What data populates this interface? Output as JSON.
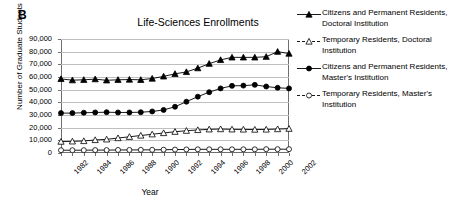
{
  "panel": {
    "label": "B"
  },
  "chart_data": {
    "type": "line",
    "title": "Life-Sciences Enrollments",
    "xlabel": "Year",
    "ylabel": "Number of Graduate Students",
    "grid": true,
    "legend_position": "right",
    "ylim": [
      0,
      90000
    ],
    "yticks": [
      "0",
      "10,000",
      "20,000",
      "30,000",
      "40,000",
      "50,000",
      "60,000",
      "70,000",
      "80,000",
      "90,000"
    ],
    "ytick_values": [
      0,
      10000,
      20000,
      30000,
      40000,
      50000,
      60000,
      70000,
      80000,
      90000
    ],
    "x": [
      1982,
      1983,
      1984,
      1985,
      1986,
      1987,
      1988,
      1989,
      1990,
      1991,
      1992,
      1993,
      1994,
      1995,
      1996,
      1997,
      1998,
      1999,
      2000,
      2001,
      2002
    ],
    "xtick_labels": [
      "1982",
      "1984",
      "1986",
      "1988",
      "1990",
      "1992",
      "1994",
      "1996",
      "1998",
      "2000",
      "2002"
    ],
    "xtick_values": [
      1982,
      1984,
      1986,
      1988,
      1990,
      1992,
      1994,
      1996,
      1998,
      2000,
      2002
    ],
    "series": [
      {
        "name": "Citizens and Permanent Residents, Doctoral Institution",
        "marker": "filled-triangle",
        "color": "#000000",
        "values": [
          58500,
          57500,
          57800,
          58300,
          57400,
          57800,
          58000,
          57800,
          58800,
          60500,
          62500,
          64000,
          67000,
          70500,
          73500,
          75500,
          75500,
          75500,
          76000,
          80000,
          78500
        ]
      },
      {
        "name": "Temporary Residents, Doctoral Institution",
        "marker": "open-triangle",
        "color": "#000000",
        "values": [
          9000,
          9200,
          9500,
          10300,
          10800,
          11800,
          12800,
          13800,
          14800,
          15800,
          16800,
          17600,
          18200,
          18700,
          18900,
          18700,
          18600,
          18500,
          18600,
          18900,
          19200
        ]
      },
      {
        "name": "Citizens and Permanent Residents, Master's Institution",
        "marker": "filled-circle",
        "color": "#000000",
        "values": [
          31500,
          31500,
          31800,
          32000,
          32200,
          32000,
          32000,
          32200,
          32800,
          34000,
          36500,
          40500,
          44500,
          48000,
          51000,
          53000,
          53200,
          53800,
          52500,
          51500,
          51000
        ]
      },
      {
        "name": "Temporary Residents, Master's Institution",
        "marker": "open-circle",
        "color": "#000000",
        "values": [
          2200,
          2200,
          2200,
          2300,
          2300,
          2400,
          2400,
          2500,
          2500,
          2600,
          2700,
          2800,
          2900,
          2900,
          2900,
          2900,
          2900,
          2900,
          3000,
          3000,
          3000
        ]
      }
    ]
  },
  "legend": {
    "items": [
      {
        "label": "Citizens and Permanent Residents, Doctoral Institution",
        "marker": "filled-triangle"
      },
      {
        "label": "Temporary Residents, Doctoral Institution",
        "marker": "open-triangle"
      },
      {
        "label": "Citizens and Permanent Residents, Master's Institution",
        "marker": "filled-circle"
      },
      {
        "label": "Temporary Residents, Master's Institution",
        "marker": "open-circle"
      }
    ]
  }
}
